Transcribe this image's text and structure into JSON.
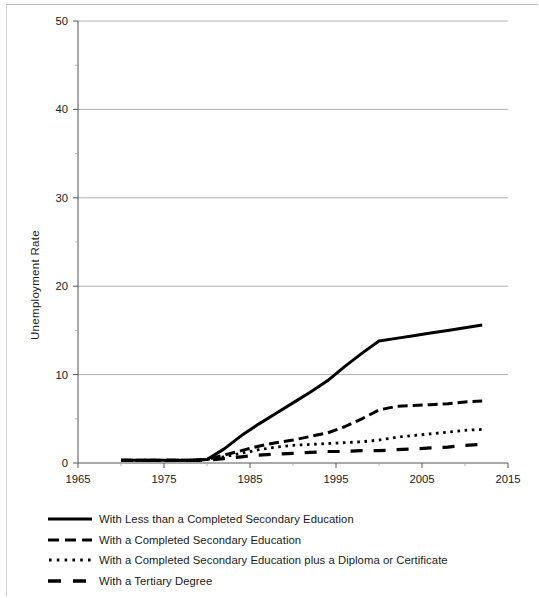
{
  "chart_data": {
    "type": "line",
    "title": "",
    "xlabel": "",
    "ylabel": "Unemployment Rate",
    "xlim": [
      1965,
      2015
    ],
    "ylim": [
      0,
      50
    ],
    "xticks": [
      1965,
      1975,
      1985,
      1995,
      2005,
      2015
    ],
    "yticks": [
      0,
      10,
      20,
      30,
      40,
      50
    ],
    "minor_yticks": [
      5,
      15,
      25,
      35,
      45
    ],
    "grid": "horizontal-major",
    "legend_position": "below-axes-left",
    "series": [
      {
        "name": "With Less than a Completed Secondary Education",
        "style": "solid",
        "x": [
          1970,
          1972,
          1974,
          1976,
          1978,
          1980,
          1982,
          1984,
          1986,
          1988,
          1990,
          1992,
          1994,
          1996,
          1998,
          2000,
          2002,
          2004,
          2006,
          2008,
          2010,
          2012
        ],
        "values": [
          0.3,
          0.3,
          0.3,
          0.3,
          0.3,
          0.4,
          1.6,
          3.1,
          4.4,
          5.6,
          6.8,
          8.0,
          9.3,
          10.9,
          12.4,
          13.8,
          14.1,
          14.4,
          14.7,
          15.0,
          15.3,
          15.6
        ]
      },
      {
        "name": "With a Completed Secondary Education",
        "style": "dashed",
        "x": [
          1970,
          1972,
          1974,
          1976,
          1978,
          1980,
          1982,
          1984,
          1986,
          1988,
          1990,
          1992,
          1994,
          1996,
          1998,
          2000,
          2002,
          2004,
          2006,
          2008,
          2010,
          2012
        ],
        "values": [
          0.3,
          0.3,
          0.3,
          0.3,
          0.3,
          0.4,
          0.9,
          1.4,
          1.9,
          2.3,
          2.6,
          3.0,
          3.4,
          4.1,
          5.0,
          6.0,
          6.4,
          6.5,
          6.6,
          6.7,
          6.9,
          7.0
        ]
      },
      {
        "name": "With a Completed Secondary Education plus a Diploma or Certificate",
        "style": "dotted",
        "x": [
          1970,
          1972,
          1974,
          1976,
          1978,
          1980,
          1982,
          1984,
          1986,
          1988,
          1990,
          1992,
          1994,
          1996,
          1998,
          2000,
          2002,
          2004,
          2006,
          2008,
          2010,
          2012
        ],
        "values": [
          0.3,
          0.3,
          0.3,
          0.3,
          0.3,
          0.4,
          0.7,
          1.1,
          1.5,
          1.8,
          2.0,
          2.1,
          2.2,
          2.3,
          2.4,
          2.6,
          2.9,
          3.1,
          3.3,
          3.5,
          3.7,
          3.8
        ]
      },
      {
        "name": "With a Tertiary Degree",
        "style": "long-dashed",
        "x": [
          1970,
          1972,
          1974,
          1976,
          1978,
          1980,
          1982,
          1984,
          1986,
          1988,
          1990,
          1992,
          1994,
          1996,
          1998,
          2000,
          2002,
          2004,
          2006,
          2008,
          2010,
          2012
        ],
        "values": [
          0.3,
          0.3,
          0.3,
          0.3,
          0.3,
          0.3,
          0.5,
          0.7,
          0.9,
          1.0,
          1.1,
          1.2,
          1.3,
          1.3,
          1.4,
          1.4,
          1.5,
          1.6,
          1.7,
          1.8,
          2.0,
          2.1
        ]
      }
    ]
  },
  "axes": {
    "y_title": "Unemployment Rate",
    "y_tick_labels": [
      "0",
      "10",
      "20",
      "30",
      "40",
      "50"
    ],
    "x_tick_labels": [
      "1965",
      "1975",
      "1985",
      "1995",
      "2005",
      "2015"
    ]
  },
  "legend": {
    "items": [
      {
        "label": "With Less than a Completed Secondary Education",
        "style": "solid"
      },
      {
        "label": "With a Completed Secondary Education",
        "style": "dashed"
      },
      {
        "label": "With a Completed Secondary Education plus a Diploma or Certificate",
        "style": "dotted"
      },
      {
        "label": "With a Tertiary Degree",
        "style": "long-dashed"
      }
    ]
  },
  "colors": {
    "line": "#000000",
    "grid": "#a8a8a8",
    "axis": "#555555",
    "text": "#1a1a1a",
    "background": "#ffffff"
  }
}
